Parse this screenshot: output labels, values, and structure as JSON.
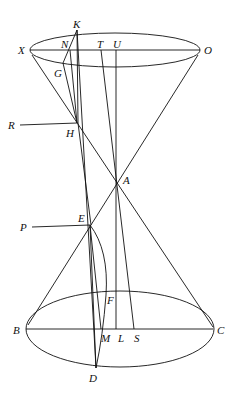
{
  "diagram": {
    "type": "double-cone geometry figure",
    "points": {
      "K": "K",
      "X": "X",
      "N": "N",
      "T": "T",
      "U": "U",
      "O": "O",
      "G": "G",
      "R": "R",
      "H": "H",
      "A": "A",
      "P": "P",
      "E": "E",
      "F": "F",
      "B": "B",
      "M": "M",
      "L": "L",
      "S": "S",
      "C": "C",
      "D": "D"
    }
  }
}
